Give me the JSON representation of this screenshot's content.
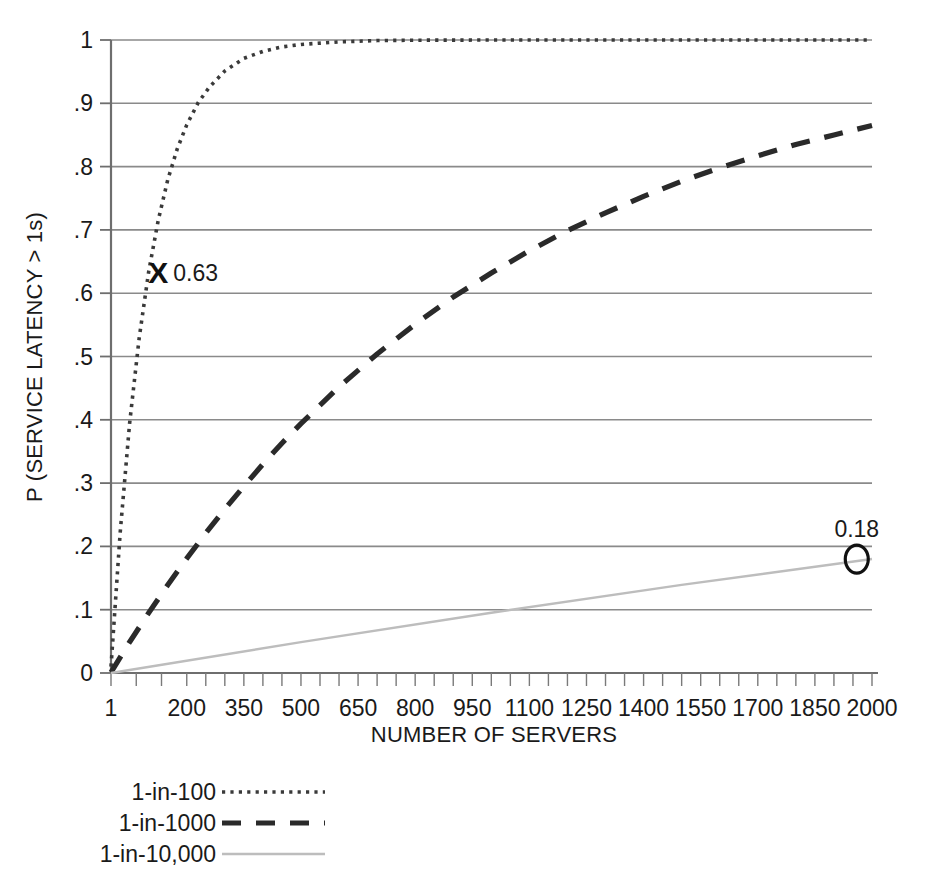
{
  "chart_data": {
    "type": "line",
    "title": "",
    "xlabel": "NUMBER OF SERVERS",
    "ylabel": "P (SERVICE LATENCY > 1s)",
    "xlim": [
      1,
      2000
    ],
    "ylim": [
      0,
      1
    ],
    "grid": true,
    "legend_position": "below-left",
    "xticks": [
      "1",
      "200",
      "350",
      "500",
      "650",
      "800",
      "950",
      "1100",
      "1250",
      "1400",
      "1550",
      "1700",
      "1850",
      "2000"
    ],
    "xtick_values": [
      1,
      200,
      350,
      500,
      650,
      800,
      950,
      1100,
      1250,
      1400,
      1550,
      1700,
      1850,
      2000
    ],
    "yticks": [
      "0",
      ".1",
      ".2",
      ".3",
      ".4",
      ".5",
      ".6",
      ".7",
      ".8",
      ".9",
      "1"
    ],
    "ytick_values": [
      0,
      0.1,
      0.2,
      0.3,
      0.4,
      0.5,
      0.6,
      0.7,
      0.8,
      0.9,
      1.0
    ],
    "series": [
      {
        "name": "1-in-100",
        "style": "dotted",
        "color": "#3a3a3a",
        "x": [
          1,
          25,
          50,
          75,
          100,
          125,
          150,
          175,
          200,
          230,
          260,
          300,
          350,
          400,
          450,
          500,
          600,
          700,
          800,
          1000,
          1200,
          1400,
          1600,
          1800,
          2000
        ],
        "y": [
          0.01,
          0.221,
          0.395,
          0.529,
          0.634,
          0.715,
          0.779,
          0.828,
          0.866,
          0.901,
          0.926,
          0.951,
          0.971,
          0.982,
          0.989,
          0.993,
          0.997,
          0.9991,
          0.9997,
          0.99995,
          0.99999,
          1.0,
          1.0,
          1.0,
          1.0
        ]
      },
      {
        "name": "1-in-1000",
        "style": "dashed",
        "color": "#2a2a2a",
        "x": [
          1,
          50,
          100,
          150,
          200,
          250,
          300,
          350,
          400,
          450,
          500,
          600,
          700,
          800,
          900,
          1000,
          1100,
          1200,
          1300,
          1400,
          1500,
          1600,
          1700,
          1800,
          1900,
          2000
        ],
        "y": [
          0.001,
          0.049,
          0.095,
          0.139,
          0.181,
          0.221,
          0.259,
          0.295,
          0.33,
          0.363,
          0.394,
          0.452,
          0.504,
          0.551,
          0.594,
          0.632,
          0.667,
          0.699,
          0.727,
          0.753,
          0.777,
          0.798,
          0.817,
          0.835,
          0.85,
          0.865
        ]
      },
      {
        "name": "1-in-10,000",
        "style": "solid",
        "color": "#bdbdbd",
        "x": [
          1,
          500,
          1000,
          1500,
          2000
        ],
        "y": [
          0.0,
          0.0488,
          0.0952,
          0.1393,
          0.18
        ]
      }
    ],
    "annotations": [
      {
        "marker": "X",
        "label": "0.63",
        "x": 125,
        "y": 0.634,
        "series": "1-in-100"
      },
      {
        "marker": "O",
        "label": "0.18",
        "x": 1960,
        "y": 0.18,
        "series": "1-in-10,000"
      }
    ]
  },
  "legend": {
    "items": [
      {
        "label": "1-in-100",
        "style": "dotted"
      },
      {
        "label": "1-in-1000",
        "style": "dashed"
      },
      {
        "label": "1-in-10,000",
        "style": "solid"
      }
    ]
  }
}
